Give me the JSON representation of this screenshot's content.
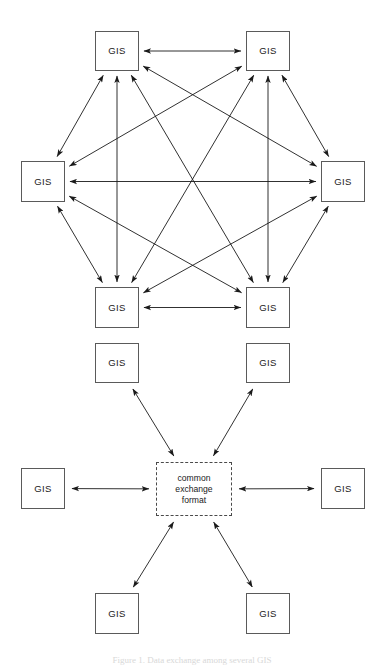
{
  "figure": {
    "caption": "Figure 1.  Data exchange among several GIS",
    "node_label": "GIS",
    "hub_label_lines": [
      "common",
      "exchange",
      "format"
    ],
    "stroke_color": "#1a1a1a",
    "box_border_color": "#5a5a5a",
    "hub_border_color": "#4a4a4a",
    "background_color": "#ffffff"
  },
  "top_diagram": {
    "name": "fully-connected-mesh",
    "description": "Six GIS systems each exchanging data directly with every other GIS",
    "edge_count": 15,
    "arrow_style": "double-headed",
    "nodes": [
      {
        "id": "t_tl",
        "label": "GIS",
        "x": 95,
        "y": 31,
        "w": 44,
        "h": 40
      },
      {
        "id": "t_tr",
        "label": "GIS",
        "x": 246,
        "y": 31,
        "w": 44,
        "h": 40
      },
      {
        "id": "t_ml",
        "label": "GIS",
        "x": 21,
        "y": 161,
        "w": 44,
        "h": 41
      },
      {
        "id": "t_mr",
        "label": "GIS",
        "x": 321,
        "y": 161,
        "w": 44,
        "h": 41
      },
      {
        "id": "t_bl",
        "label": "GIS",
        "x": 95,
        "y": 287,
        "w": 44,
        "h": 41
      },
      {
        "id": "t_br",
        "label": "GIS",
        "x": 246,
        "y": 287,
        "w": 44,
        "h": 41
      }
    ],
    "edges": [
      [
        "t_tl",
        "t_tr"
      ],
      [
        "t_tl",
        "t_ml"
      ],
      [
        "t_tl",
        "t_mr"
      ],
      [
        "t_tl",
        "t_bl"
      ],
      [
        "t_tl",
        "t_br"
      ],
      [
        "t_tr",
        "t_ml"
      ],
      [
        "t_tr",
        "t_mr"
      ],
      [
        "t_tr",
        "t_bl"
      ],
      [
        "t_tr",
        "t_br"
      ],
      [
        "t_ml",
        "t_mr"
      ],
      [
        "t_ml",
        "t_bl"
      ],
      [
        "t_ml",
        "t_br"
      ],
      [
        "t_mr",
        "t_bl"
      ],
      [
        "t_mr",
        "t_br"
      ],
      [
        "t_bl",
        "t_br"
      ]
    ]
  },
  "bottom_diagram": {
    "name": "common-exchange-format-hub",
    "description": "Six GIS systems each exchanging data through a common exchange format",
    "edge_count": 6,
    "arrow_style": "double-headed",
    "hub": {
      "id": "hub",
      "x": 156,
      "y": 462,
      "w": 76,
      "h": 54
    },
    "nodes": [
      {
        "id": "b_tl",
        "label": "GIS",
        "x": 95,
        "y": 343,
        "w": 44,
        "h": 40
      },
      {
        "id": "b_tr",
        "label": "GIS",
        "x": 246,
        "y": 343,
        "w": 44,
        "h": 40
      },
      {
        "id": "b_ml",
        "label": "GIS",
        "x": 21,
        "y": 468,
        "w": 44,
        "h": 41
      },
      {
        "id": "b_mr",
        "label": "GIS",
        "x": 321,
        "y": 468,
        "w": 44,
        "h": 41
      },
      {
        "id": "b_bl",
        "label": "GIS",
        "x": 95,
        "y": 593,
        "w": 44,
        "h": 41
      },
      {
        "id": "b_br",
        "label": "GIS",
        "x": 246,
        "y": 593,
        "w": 44,
        "h": 41
      }
    ],
    "edges": [
      [
        "b_tl",
        "hub"
      ],
      [
        "b_tr",
        "hub"
      ],
      [
        "b_ml",
        "hub"
      ],
      [
        "b_mr",
        "hub"
      ],
      [
        "b_bl",
        "hub"
      ],
      [
        "b_br",
        "hub"
      ]
    ]
  }
}
